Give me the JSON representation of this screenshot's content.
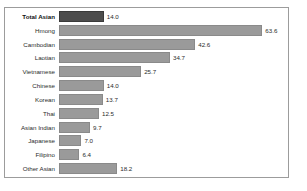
{
  "chart_data": {
    "type": "bar",
    "orientation": "horizontal",
    "title": "",
    "xlabel": "",
    "ylabel": "",
    "xlim": [
      0,
      71
    ],
    "grid": false,
    "legend": false,
    "categories": [
      "Total Asian",
      "Hmong",
      "Cambodian",
      "Laotian",
      "Vietnamese",
      "Chinese",
      "Korean",
      "Thai",
      "Asian Indian",
      "Japanese",
      "Filipino",
      "Other Asian"
    ],
    "values": [
      14.0,
      63.6,
      42.6,
      34.7,
      25.7,
      14.0,
      13.7,
      12.5,
      9.7,
      7.0,
      6.4,
      18.2
    ],
    "value_labels": [
      "14.0",
      "63.6",
      "42.6",
      "34.7",
      "25.7",
      "14.0",
      "13.7",
      "12.5",
      "9.7",
      "7.0",
      "6.4",
      "18.2"
    ],
    "highlight_index": 0,
    "colors": {
      "bar": "#9a9a9a",
      "bar_border": "#8a8a8a",
      "highlight_bar": "#4d4d4d",
      "highlight_bar_border": "#3a3a3a",
      "frame": "#9c9c9c",
      "text": "#2b2b2b",
      "background": "#ffffff"
    }
  }
}
